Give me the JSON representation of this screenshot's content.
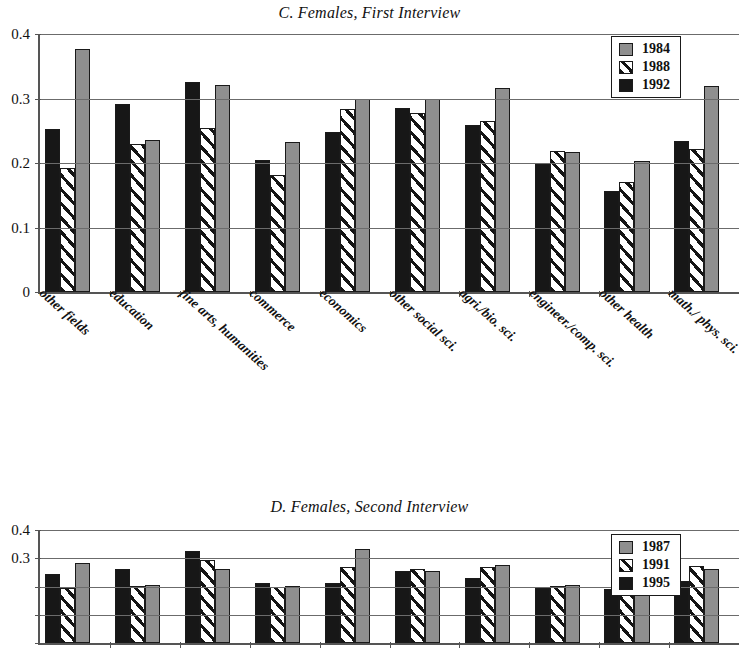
{
  "figure": {
    "panels": [
      {
        "id": "C",
        "title": "C. Females, First Interview",
        "legend": {
          "entries": [
            "1984",
            "1988",
            "1992"
          ]
        }
      },
      {
        "id": "D",
        "title": "D. Females, Second Interview",
        "legend": {
          "entries": [
            "1987",
            "1991",
            "1995"
          ]
        }
      }
    ]
  },
  "chart_data": [
    {
      "type": "bar",
      "panel": "C",
      "title": "C. Females, First Interview",
      "xlabel": "",
      "ylabel": "",
      "ylim": [
        0,
        0.4
      ],
      "yticks": [
        0,
        0.1,
        0.2,
        0.3,
        0.4
      ],
      "ytick_labels": [
        "0",
        "0.1",
        "0.2",
        "0.3",
        "0.4"
      ],
      "grid": true,
      "legend_position": "top-right",
      "bar_draw_order": [
        "1992",
        "1988",
        "1984"
      ],
      "categories": [
        "other fields",
        "education",
        "fine arts, humanities",
        "commerce",
        "economics",
        "other social  sci.",
        "agri./bio. sci.",
        "engineer./comp. sci.",
        "other health",
        "math./ phys. sci."
      ],
      "series": [
        {
          "name": "1984",
          "color": "#8f8f8f",
          "values": [
            0.376,
            0.236,
            0.321,
            0.233,
            0.3,
            0.3,
            0.317,
            0.217,
            0.203,
            0.32
          ]
        },
        {
          "name": "1988",
          "color": "#ffffff",
          "pattern": "diagonal-hatch",
          "values": [
            0.193,
            0.23,
            0.255,
            0.181,
            0.283,
            0.278,
            0.265,
            0.218,
            0.17,
            0.221
          ]
        },
        {
          "name": "1992",
          "color": "#171717",
          "values": [
            0.253,
            0.292,
            0.325,
            0.204,
            0.248,
            0.286,
            0.259,
            0.199,
            0.157,
            0.234
          ]
        }
      ]
    },
    {
      "type": "bar",
      "panel": "D",
      "title": "D. Females, Second Interview",
      "xlabel": "",
      "ylabel": "",
      "ylim": [
        0,
        0.4
      ],
      "yticks": [
        0,
        0.1,
        0.2,
        0.3,
        0.4
      ],
      "ytick_labels": [
        "0",
        "0.1",
        "0.2",
        "0.3",
        "0.4"
      ],
      "visible_ytick_labels": [
        "0.3",
        "0.4"
      ],
      "grid": true,
      "legend_position": "top-right",
      "bar_draw_order": [
        "1995",
        "1991",
        "1987"
      ],
      "note_cropped": "Panel D is cut off by the bottom edge of the screenshot; only values above ~0.20 are visible.",
      "categories": [
        "other fields",
        "education",
        "fine arts, humanities",
        "commerce",
        "economics",
        "other social  sci.",
        "agri./bio. sci.",
        "engineer./comp. sci.",
        "other health",
        "math./ phys. sci."
      ],
      "series": [
        {
          "name": "1987",
          "color": "#8f8f8f",
          "values": [
            0.284,
            0.205,
            0.263,
            0.203,
            0.334,
            0.255,
            0.277,
            0.205,
            0.207,
            0.262
          ]
        },
        {
          "name": "1991",
          "color": "#ffffff",
          "pattern": "diagonal-hatch",
          "values": [
            0.196,
            0.203,
            0.294,
            0.2,
            0.268,
            0.262,
            0.268,
            0.202,
            0.199,
            0.272
          ]
        },
        {
          "name": "1995",
          "color": "#171717",
          "values": [
            0.243,
            0.263,
            0.325,
            0.211,
            0.211,
            0.254,
            0.229,
            0.196,
            0.19,
            0.219
          ]
        }
      ]
    }
  ]
}
